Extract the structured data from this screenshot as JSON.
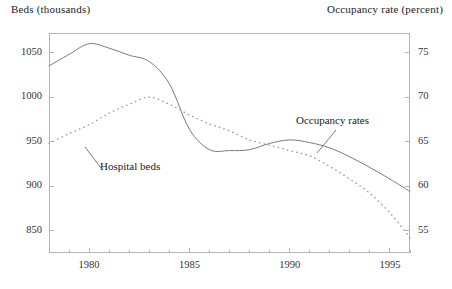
{
  "axes": {
    "left_title": "Beds (thousands)",
    "right_title": "Occupancy rate (percent)",
    "left_ticks": [
      "850",
      "900",
      "950",
      "1000",
      "1050"
    ],
    "right_ticks": [
      "55",
      "60",
      "65",
      "70",
      "75"
    ],
    "x_ticks": [
      "1980",
      "1985",
      "1990",
      "1995"
    ]
  },
  "annotations": {
    "hospital_beds": "Hospital beds",
    "occupancy_rates": "Occupancy rates"
  },
  "chart_data": {
    "type": "line",
    "title": "",
    "xlabel": "",
    "ylabel": "Beds (thousands)",
    "y2label": "Occupancy rate (percent)",
    "xlim": [
      1978,
      1996
    ],
    "ylim": [
      825,
      1072
    ],
    "y2lim": [
      52.5,
      77.2
    ],
    "grid": false,
    "legend": "inline-annotations",
    "x": [
      1978,
      1979,
      1980,
      1981,
      1982,
      1983,
      1984,
      1985,
      1986,
      1987,
      1988,
      1989,
      1990,
      1991,
      1992,
      1993,
      1994,
      1995,
      1996
    ],
    "series": [
      {
        "name": "Hospital beds",
        "axis": "left",
        "style": "solid",
        "color": "#7a7a7a",
        "units": "thousands",
        "values": [
          1035,
          1048,
          1060,
          1055,
          1047,
          1040,
          1015,
          964,
          941,
          940,
          941,
          948,
          952,
          949,
          943,
          933,
          921,
          908,
          894
        ]
      },
      {
        "name": "Occupancy rates",
        "axis": "right",
        "style": "dotted",
        "color": "#9a9a9a",
        "units": "percent",
        "values": [
          64.8,
          65.9,
          66.9,
          68.2,
          69.2,
          70.0,
          69.2,
          68.0,
          67.0,
          66.2,
          65.2,
          64.6,
          64.0,
          63.4,
          62.2,
          60.8,
          59.2,
          57.0,
          54.2
        ]
      }
    ]
  }
}
